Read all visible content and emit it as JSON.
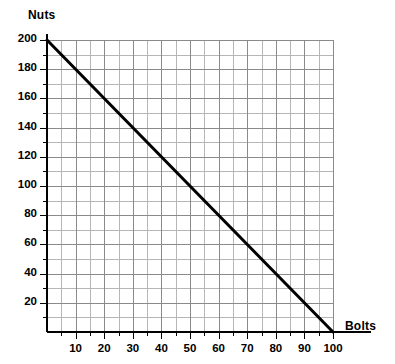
{
  "chart_data": {
    "type": "line",
    "title": "",
    "subtitle": "",
    "xlabel": "Bolts",
    "ylabel": "Nuts",
    "xlim": [
      0,
      100
    ],
    "ylim": [
      0,
      200
    ],
    "grid": true,
    "legend": false,
    "legend_position": "none",
    "x_major_ticks": [
      10,
      20,
      30,
      40,
      50,
      60,
      70,
      80,
      90,
      100
    ],
    "x_major_tick_labels": [
      "10",
      "20",
      "30",
      "40",
      "50",
      "60",
      "70",
      "80",
      "90",
      "100"
    ],
    "x_minor_tick_step": 5,
    "y_major_ticks": [
      20,
      40,
      60,
      80,
      100,
      120,
      140,
      160,
      180,
      200
    ],
    "y_major_tick_labels": [
      "20",
      "40",
      "60",
      "80",
      "100",
      "120",
      "140",
      "160",
      "180",
      "200"
    ],
    "y_minor_tick_step": 10,
    "series": [
      {
        "name": "Production possibility frontier",
        "type": "line",
        "color": "#000000",
        "x": [
          0,
          100
        ],
        "y": [
          200,
          0
        ],
        "points": [
          {
            "x": 0,
            "y": 200
          },
          {
            "x": 10,
            "y": 180
          },
          {
            "x": 20,
            "y": 160
          },
          {
            "x": 30,
            "y": 140
          },
          {
            "x": 40,
            "y": 120
          },
          {
            "x": 50,
            "y": 100
          },
          {
            "x": 60,
            "y": 80
          },
          {
            "x": 70,
            "y": 60
          },
          {
            "x": 80,
            "y": 40
          },
          {
            "x": 90,
            "y": 20
          },
          {
            "x": 100,
            "y": 0
          }
        ],
        "slope": -2,
        "intercept": 200
      }
    ],
    "annotations": [],
    "colors": {
      "line": "#000000",
      "axis": "#000000",
      "grid_major": "#8a8a8a",
      "grid_minor": "#b6b6b6",
      "background": "#ffffff",
      "text": "#000000"
    }
  },
  "axes": {
    "y_title": "Nuts",
    "x_title": "Bolts"
  },
  "y_ticks": [
    {
      "label": "200"
    },
    {
      "label": "180"
    },
    {
      "label": "160"
    },
    {
      "label": "140"
    },
    {
      "label": "120"
    },
    {
      "label": "100"
    },
    {
      "label": "80"
    },
    {
      "label": "60"
    },
    {
      "label": "40"
    },
    {
      "label": "20"
    }
  ],
  "x_ticks": [
    {
      "label": "10"
    },
    {
      "label": "20"
    },
    {
      "label": "30"
    },
    {
      "label": "40"
    },
    {
      "label": "50"
    },
    {
      "label": "60"
    },
    {
      "label": "70"
    },
    {
      "label": "80"
    },
    {
      "label": "90"
    },
    {
      "label": "100"
    }
  ]
}
